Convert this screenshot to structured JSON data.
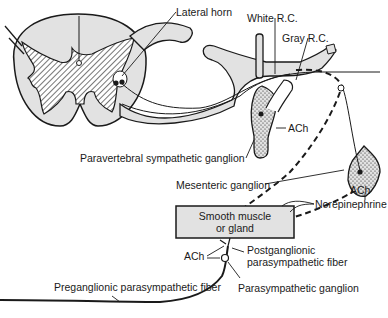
{
  "diagram": {
    "colors": {
      "line": "#1a1a1a",
      "fill_gray": "#e2e2e2",
      "background": "#ffffff"
    },
    "labels": {
      "lateral_horn": "Lateral horn",
      "white_rc": "White R.C.",
      "gray_rc": "Gray R.C.",
      "ach_paravertebral": "ACh",
      "paravertebral_ganglion": "Paravertebral sympathetic ganglion",
      "mesenteric_ganglion": "Mesenteric ganglion",
      "ach_mesenteric": "ACh",
      "norepinephrine": "Norepinephrine",
      "effector_line1": "Smooth muscle",
      "effector_line2": "or gland",
      "ach_parasympathetic": "ACh",
      "postganglionic_line1": "Postganglionic",
      "postganglionic_line2": "parasympathetic fiber",
      "preganglionic": "Preganglionic parasympathetic fiber",
      "parasympathetic_ganglion": "Parasympathetic ganglion"
    }
  }
}
